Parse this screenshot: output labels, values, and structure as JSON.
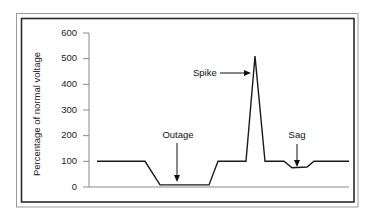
{
  "chart_data": {
    "type": "line",
    "title": "",
    "xlabel": "",
    "ylabel": "Percentage of normal voltage",
    "ylim": [
      0,
      600
    ],
    "yticks": [
      0,
      100,
      200,
      300,
      400,
      500,
      600
    ],
    "ytick_labels": [
      "0",
      "100",
      "200",
      "300",
      "400",
      "500",
      "600"
    ],
    "grid": false,
    "legend": null,
    "x_unit": "time (unlabeled, arbitrary units)",
    "series": [
      {
        "name": "Voltage",
        "x": [
          0,
          48,
          63,
          112,
          121,
          149,
          158,
          168,
          187,
          195,
          210,
          217,
          252
        ],
        "values": [
          100,
          100,
          8,
          8,
          100,
          100,
          510,
          100,
          100,
          75,
          78,
          100,
          100
        ]
      }
    ],
    "annotations": [
      {
        "text": "Outage",
        "arrow": "down",
        "target_x": 80,
        "target_value": 8
      },
      {
        "text": "Spike",
        "arrow": "right",
        "target_x": 153,
        "target_value": 440
      },
      {
        "text": "Sag",
        "arrow": "down",
        "target_x": 200,
        "target_value": 78
      }
    ]
  },
  "labels": {
    "ylabel": "Percentage of normal voltage",
    "outage": "Outage",
    "spike": "Spike",
    "sag": "Sag"
  }
}
